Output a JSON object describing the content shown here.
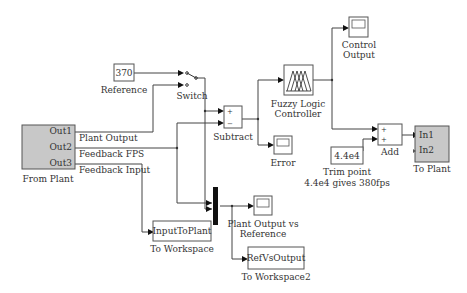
{
  "diagram": {
    "type": "simulink-model",
    "blocks": {
      "from_plant": {
        "label": "From Plant",
        "ports": [
          "Out1",
          "Out2",
          "Out3"
        ]
      },
      "reference": {
        "value": "370",
        "label": "Reference"
      },
      "switch": {
        "label": "Switch"
      },
      "subtract": {
        "label": "Subtract",
        "signs": [
          "+",
          "−"
        ]
      },
      "error": {
        "label": "Error"
      },
      "fuzzy": {
        "label_line1": "Fuzzy Logic",
        "label_line2": "Controller"
      },
      "control_output": {
        "label_line1": "Control",
        "label_line2": "Output"
      },
      "add": {
        "label": "Add",
        "signs": [
          "+",
          "+"
        ]
      },
      "trim": {
        "value": "4.4e4",
        "label_line1": "Trim point",
        "label_line2": "4.4e4 gives 380fps"
      },
      "to_plant": {
        "label": "To Plant",
        "ports": [
          "In1",
          "In2"
        ]
      },
      "input_to_plant": {
        "value": "InputToPlant",
        "label": "To Workspace"
      },
      "plant_vs_ref": {
        "label_line1": "Plant Output vs",
        "label_line2": "Reference"
      },
      "ref_vs_output": {
        "value": "RefVsOutput",
        "label": "To Workspace2"
      }
    },
    "signals": {
      "plant_output": "Plant Output",
      "feedback_fps": "Feedback FPS",
      "feedback_input": "Feedback Input"
    }
  }
}
